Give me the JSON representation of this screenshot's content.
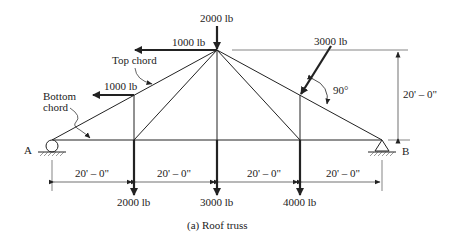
{
  "diagram": {
    "caption": "(a)  Roof truss",
    "loads": {
      "apex_vertical": "2000 lb",
      "apex_horizontal": "1000 lb",
      "top_left_horizontal": "1000 lb",
      "top_right_inclined": "3000 lb",
      "bottom_left": "2000 lb",
      "bottom_center": "3000 lb",
      "bottom_right": "4000 lb"
    },
    "annotations": {
      "top_chord": "Top chord",
      "bottom_chord_line1": "Bottom",
      "bottom_chord_line2": "chord",
      "angle": "90°"
    },
    "supports": {
      "left": "A",
      "right": "B"
    },
    "dimensions": {
      "height": "20' – 0\"",
      "spans": [
        "20' – 0\"",
        "20' – 0\"",
        "20' – 0\"",
        "20' – 0\""
      ]
    },
    "colors": {
      "line": "#222222",
      "background": "#ffffff"
    }
  }
}
